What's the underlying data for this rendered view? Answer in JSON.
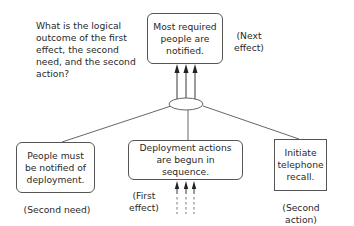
{
  "question": "What is the logical outcome of the first effect, the second need, and the second action?",
  "nodes": {
    "top": {
      "text": "Most required people are notified.",
      "annotation": "(Next effect)"
    },
    "left": {
      "text": "People must be notified of deployment.",
      "annotation": "(Second need)"
    },
    "center": {
      "text": "Deployment actions are begun in sequence.",
      "annotation": "(First effect)"
    },
    "right": {
      "text": "Initiate telephone recall.",
      "annotation": "(Second action)"
    }
  }
}
